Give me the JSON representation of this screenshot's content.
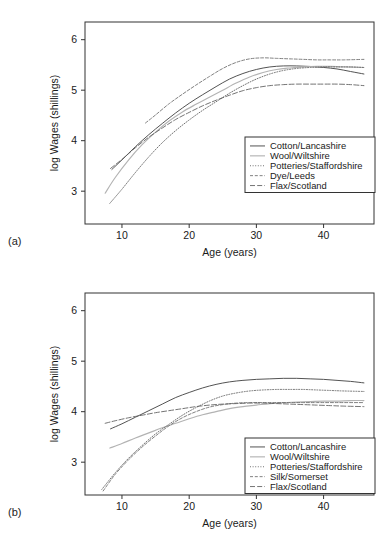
{
  "figure": {
    "panels": [
      {
        "tag": "(a)",
        "xlabel": "Age (years)",
        "ylabel": "log Wages (shillings)",
        "xticks": [
          "10",
          "20",
          "30",
          "40"
        ],
        "yticks": [
          "3",
          "4",
          "5",
          "6"
        ],
        "legend": [
          "Cotton/Lancashire",
          "Wool/Wiltshire",
          "Potteries/Staffordshire",
          "Dye/Leeds",
          "Flax/Scotland"
        ]
      },
      {
        "tag": "(b)",
        "xlabel": "Age (years)",
        "ylabel": "log Wages (shillings)",
        "xticks": [
          "10",
          "20",
          "30",
          "40"
        ],
        "yticks": [
          "3",
          "4",
          "5",
          "6"
        ],
        "legend": [
          "Cotton/Lancashire",
          "Wool/Wiltshire",
          "Potteries/Staffordshire",
          "Silk/Somerset",
          "Flax/Scotland"
        ]
      }
    ]
  },
  "chart_data": [
    {
      "type": "line",
      "panel": "(a)",
      "title": "",
      "xlabel": "Age (years)",
      "ylabel": "log Wages (shillings)",
      "xlim": [
        4.5,
        47.5
      ],
      "ylim": [
        2.35,
        6.35
      ],
      "xticks": [
        10,
        20,
        30,
        40
      ],
      "yticks": [
        3,
        4,
        5,
        6
      ],
      "grid": false,
      "legend_position": "lower right",
      "series": [
        {
          "name": "Cotton/Lancashire",
          "linestyle": "solid",
          "color": "#4a4a4a",
          "x": [
            8.5,
            10,
            12,
            14,
            16,
            18,
            20,
            22,
            24,
            26,
            28,
            30,
            32,
            34,
            36,
            38,
            40,
            42,
            44,
            46
          ],
          "y": [
            3.43,
            3.62,
            3.88,
            4.12,
            4.34,
            4.55,
            4.74,
            4.91,
            5.07,
            5.22,
            5.33,
            5.41,
            5.46,
            5.48,
            5.48,
            5.47,
            5.45,
            5.42,
            5.37,
            5.32
          ]
        },
        {
          "name": "Wool/Wiltshire",
          "linestyle": "solid-light",
          "color": "#b3b3b3",
          "x": [
            7.5,
            9,
            11,
            13,
            15,
            17,
            19,
            21,
            23,
            25,
            27,
            29,
            31,
            33,
            35,
            37,
            39,
            41,
            43,
            46
          ],
          "y": [
            2.96,
            3.27,
            3.62,
            3.92,
            4.17,
            4.39,
            4.57,
            4.72,
            4.86,
            5.0,
            5.14,
            5.26,
            5.35,
            5.41,
            5.44,
            5.46,
            5.47,
            5.47,
            5.46,
            5.45
          ]
        },
        {
          "name": "Potteries/Staffordshire",
          "linestyle": "dotted",
          "color": "#5a5a5a",
          "x": [
            8.2,
            10,
            12,
            14,
            16,
            18,
            20,
            22,
            24,
            26,
            28,
            30,
            32,
            34,
            36,
            38,
            40,
            42,
            44,
            46
          ],
          "y": [
            2.76,
            3.04,
            3.37,
            3.68,
            3.96,
            4.2,
            4.41,
            4.6,
            4.77,
            4.94,
            5.09,
            5.22,
            5.32,
            5.39,
            5.43,
            5.45,
            5.46,
            5.46,
            5.46,
            5.45
          ]
        },
        {
          "name": "Dye/Leeds",
          "linestyle": "dashed-fine",
          "color": "#6a6a6a",
          "x": [
            13.5,
            15,
            17,
            19,
            21,
            23,
            25,
            27,
            29,
            31,
            33,
            35,
            37,
            39,
            41,
            43,
            46
          ],
          "y": [
            4.35,
            4.51,
            4.73,
            4.92,
            5.1,
            5.27,
            5.43,
            5.55,
            5.62,
            5.64,
            5.63,
            5.62,
            5.61,
            5.6,
            5.6,
            5.6,
            5.61
          ]
        },
        {
          "name": "Flax/Scotland",
          "linestyle": "dashdot",
          "color": "#5a5a5a",
          "x": [
            8.3,
            10,
            12,
            14,
            16,
            18,
            20,
            22,
            24,
            26,
            28,
            30,
            32,
            34,
            36,
            38,
            40,
            42,
            44,
            46
          ],
          "y": [
            3.45,
            3.63,
            3.86,
            4.07,
            4.25,
            4.42,
            4.56,
            4.69,
            4.8,
            4.9,
            4.99,
            5.05,
            5.09,
            5.11,
            5.12,
            5.12,
            5.12,
            5.12,
            5.11,
            5.09
          ]
        }
      ]
    },
    {
      "type": "line",
      "panel": "(b)",
      "title": "",
      "xlabel": "Age (years)",
      "ylabel": "log Wages (shillings)",
      "xlim": [
        4.5,
        47.5
      ],
      "ylim": [
        2.35,
        6.35
      ],
      "xticks": [
        10,
        20,
        30,
        40
      ],
      "yticks": [
        3,
        4,
        5,
        6
      ],
      "grid": false,
      "legend_position": "lower right",
      "series": [
        {
          "name": "Cotton/Lancashire",
          "linestyle": "solid",
          "color": "#4a4a4a",
          "x": [
            8.3,
            10,
            12,
            14,
            16,
            18,
            20,
            22,
            24,
            26,
            28,
            30,
            32,
            34,
            36,
            38,
            40,
            42,
            44,
            46
          ],
          "y": [
            3.66,
            3.76,
            3.89,
            4.02,
            4.15,
            4.28,
            4.38,
            4.47,
            4.54,
            4.59,
            4.62,
            4.64,
            4.65,
            4.66,
            4.66,
            4.65,
            4.64,
            4.62,
            4.6,
            4.57
          ]
        },
        {
          "name": "Wool/Wiltshire",
          "linestyle": "solid-light",
          "color": "#b3b3b3",
          "x": [
            8.2,
            10,
            12,
            14,
            16,
            18,
            20,
            22,
            24,
            26,
            28,
            30,
            32,
            34,
            36,
            38,
            40,
            42,
            44,
            46
          ],
          "y": [
            3.28,
            3.37,
            3.48,
            3.58,
            3.68,
            3.77,
            3.86,
            3.94,
            4.0,
            4.06,
            4.1,
            4.13,
            4.16,
            4.18,
            4.19,
            4.2,
            4.21,
            4.21,
            4.22,
            4.22
          ]
        },
        {
          "name": "Potteries/Staffordshire",
          "linestyle": "dotted",
          "color": "#5a5a5a",
          "x": [
            7.0,
            9,
            11,
            13,
            15,
            17,
            19,
            21,
            23,
            25,
            27,
            29,
            31,
            33,
            35,
            37,
            39,
            41,
            43,
            46
          ],
          "y": [
            2.46,
            2.79,
            3.08,
            3.33,
            3.56,
            3.75,
            3.93,
            4.08,
            4.21,
            4.31,
            4.37,
            4.41,
            4.43,
            4.44,
            4.44,
            4.44,
            4.43,
            4.42,
            4.41,
            4.4
          ]
        },
        {
          "name": "Silk/Somerset",
          "linestyle": "dashed-fine",
          "color": "#6a6a6a",
          "x": [
            7.2,
            9,
            11,
            13,
            15,
            17,
            19,
            21,
            23,
            25,
            27,
            29,
            31,
            33,
            35,
            37,
            39,
            41,
            43,
            46
          ],
          "y": [
            2.43,
            2.76,
            3.05,
            3.3,
            3.52,
            3.72,
            3.88,
            4.0,
            4.09,
            4.14,
            4.17,
            4.18,
            4.18,
            4.18,
            4.18,
            4.18,
            4.18,
            4.18,
            4.18,
            4.18
          ]
        },
        {
          "name": "Flax/Scotland",
          "linestyle": "dashdot",
          "color": "#5a5a5a",
          "x": [
            7.5,
            9,
            11,
            13,
            15,
            17,
            19,
            21,
            23,
            25,
            27,
            29,
            31,
            33,
            35,
            37,
            39,
            41,
            43,
            46
          ],
          "y": [
            3.77,
            3.82,
            3.88,
            3.93,
            3.98,
            4.02,
            4.06,
            4.1,
            4.13,
            4.15,
            4.16,
            4.17,
            4.17,
            4.16,
            4.15,
            4.14,
            4.13,
            4.12,
            4.11,
            4.1
          ]
        }
      ]
    }
  ]
}
